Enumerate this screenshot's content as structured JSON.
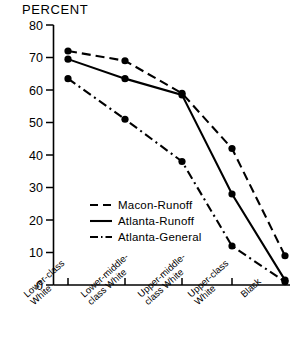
{
  "chart_data": {
    "type": "line",
    "title": "PERCENT",
    "xlabel": "",
    "ylabel": "PERCENT",
    "ylim": [
      0,
      80
    ],
    "ytick_step": 10,
    "yticks": [
      "80",
      "70",
      "60",
      "50",
      "40",
      "30",
      "20",
      "10",
      "0"
    ],
    "grid": false,
    "legend_position": "center-left",
    "categories": [
      "Lower-class White",
      "Lower-middle-class White",
      "Upper-middle-class White",
      "Upper-class White",
      "Black"
    ],
    "category_lines": [
      [
        "Lower-class",
        "White"
      ],
      [
        "Lower-middle-",
        "class White"
      ],
      [
        "Upper-middle-",
        "class White"
      ],
      [
        "Upper-class",
        "White"
      ],
      [
        "Black"
      ]
    ],
    "series": [
      {
        "name": "Macon-Runoff",
        "style": "dashed",
        "color": "#000000",
        "values": [
          72,
          69,
          59,
          42,
          9
        ]
      },
      {
        "name": "Atlanta-Runoff",
        "style": "solid",
        "color": "#000000",
        "values": [
          69.5,
          63.5,
          58.5,
          28,
          1.5
        ]
      },
      {
        "name": "Atlanta-General",
        "style": "dash-dot",
        "color": "#000000",
        "values": [
          63.5,
          51,
          38,
          12,
          1
        ]
      }
    ]
  },
  "legend": {
    "items": [
      {
        "label": "Macon-Runoff"
      },
      {
        "label": "Atlanta-Runoff"
      },
      {
        "label": "Atlanta-General"
      }
    ]
  },
  "axis": {
    "title": "PERCENT",
    "y_labels": [
      "80",
      "70",
      "60",
      "50",
      "40",
      "30",
      "20",
      "10",
      "0"
    ]
  }
}
